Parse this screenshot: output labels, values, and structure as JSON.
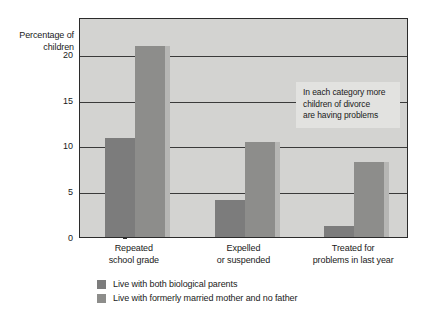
{
  "chart_data": {
    "type": "bar",
    "title": "",
    "subtitle": "",
    "ylabel": "Percentage of children",
    "ylabel_lines": [
      "Percentage",
      "of children"
    ],
    "xlabel": "",
    "categories": [
      "Repeated school grade",
      "Expelled or suspended",
      "Treated for problems in last year"
    ],
    "category_label_lines": [
      [
        "Repeated",
        "school grade"
      ],
      [
        "Expelled",
        "or suspended"
      ],
      [
        "Treated for",
        "problems in last year"
      ]
    ],
    "series": [
      {
        "name": "Live with both biological parents",
        "color": "#7c7c7c",
        "values": [
          10.8,
          4.0,
          1.2
        ]
      },
      {
        "name": "Live with formerly married mother and no father",
        "color": "#8d8d8b",
        "values": [
          20.8,
          10.4,
          8.2
        ]
      }
    ],
    "ylim": [
      0,
      24
    ],
    "yticks": [
      0,
      5,
      10,
      15,
      20
    ],
    "ytick_labels": [
      "0",
      "5",
      "10",
      "15",
      "20"
    ],
    "grid": true,
    "legend_position": "bottom-left",
    "annotations": [
      {
        "text": "In each category more children of divorce are having problems",
        "lines": [
          "In each category more",
          "children of divorce",
          "are having problems"
        ]
      }
    ],
    "plot_background": "#d3d3d1",
    "page_background": "#ffffff"
  }
}
